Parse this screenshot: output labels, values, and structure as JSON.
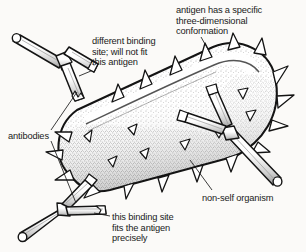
{
  "figure": {
    "background_color": "#fbfaf8",
    "ink_color": "#1a1a1a"
  },
  "labels": {
    "conformation": "antigen has a specific\nthree-dimensional\nconformation",
    "different_binding": "different binding\nsite; will not fit\nthis antigen",
    "antibodies": "antibodies",
    "nonself": "non-self organism",
    "fits": "this binding site\nfits the antigen\nprecisely"
  },
  "diagram": {
    "organism": {
      "name": "non-self organism",
      "shape": "stippled capsule",
      "spike_count": 24,
      "spike_shape": "triangle",
      "outline_color": "#1a1a1a",
      "fill_color": "#ffffff",
      "stipple_color": "#4a4a4a"
    },
    "antibodies": [
      {
        "id": "antibody-top-left",
        "state": "unbound",
        "note": "different binding site; will not fit this antigen"
      },
      {
        "id": "antibody-right",
        "state": "bound",
        "note": "binding site fits the antigen"
      },
      {
        "id": "antibody-bottom-left",
        "state": "bound",
        "note": "this binding site fits the antigen precisely"
      }
    ],
    "leader_lines": [
      {
        "from": "conformation",
        "to": "organism-spike-top"
      },
      {
        "from": "different_binding",
        "to": "antibody-top-left-arm"
      },
      {
        "from": "antibodies",
        "to": "antibody-top-left-stem"
      },
      {
        "from": "antibodies",
        "to": "antibody-bottom-left-stem"
      },
      {
        "from": "nonself",
        "to": "organism-body"
      },
      {
        "from": "fits",
        "to": "antibody-bottom-left-fork"
      }
    ]
  }
}
